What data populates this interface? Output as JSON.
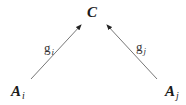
{
  "diagram": {
    "nodes": [
      {
        "id": "C",
        "label": "C",
        "subscript": ""
      },
      {
        "id": "A_i",
        "label": "A",
        "subscript": "i"
      },
      {
        "id": "A_j",
        "label": "A",
        "subscript": "j"
      }
    ],
    "edges": [
      {
        "from": "A_i",
        "to": "C",
        "label": "g",
        "subscript": "i"
      },
      {
        "from": "A_j",
        "to": "C",
        "label": "g",
        "subscript": "j"
      }
    ],
    "colors": {
      "text": "#1a1a1a",
      "edge": "#777777",
      "arrowhead": "#222222",
      "background": "#ffffff"
    }
  }
}
